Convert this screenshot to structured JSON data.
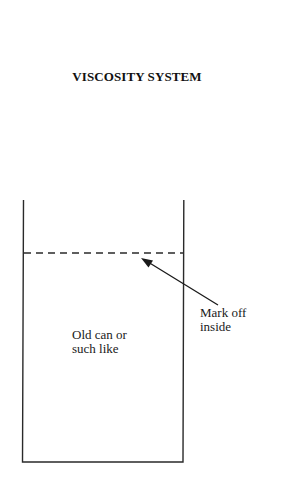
{
  "diagram": {
    "title": "VISCOSITY SYSTEM",
    "container": {
      "shape": "open-top rectangle (can)",
      "label_lines": [
        "Old can or",
        "such like"
      ]
    },
    "fill_mark": {
      "style": "dashed horizontal line",
      "label_lines": [
        "Mark off",
        "inside"
      ]
    },
    "arrow": {
      "from": "mark-off label",
      "to": "dashed fill line"
    },
    "colors": {
      "ink": "#1a1a1a",
      "background": "#ffffff"
    }
  }
}
